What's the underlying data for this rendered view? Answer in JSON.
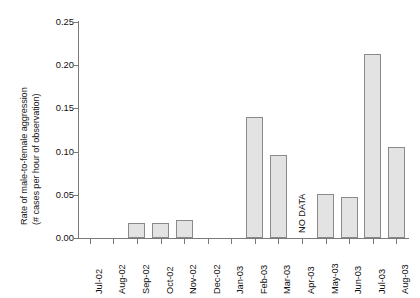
{
  "chart_data": {
    "type": "bar",
    "title": "",
    "xlabel": "",
    "ylabel_line1": "Rate of male-to-female aggression",
    "ylabel_line2": "(# cases per hour of observation)",
    "ylim": [
      0,
      0.25
    ],
    "ytick_labels": [
      "0.25",
      "0.20",
      "0.15",
      "0.10",
      "0.05",
      "0.00"
    ],
    "ytick_values": [
      0.25,
      0.2,
      0.15,
      0.1,
      0.05,
      0.0
    ],
    "grid": false,
    "legend": "none",
    "categories": [
      "Jul-02",
      "Aug-02",
      "Sep-02",
      "Oct-02",
      "Nov-02",
      "Dec-02",
      "Jan-03",
      "Feb-03",
      "Mar-03",
      "Apr-03",
      "May-03",
      "Jun-03",
      "Jul-03",
      "Aug-03"
    ],
    "values": [
      0,
      0,
      0.017,
      0.017,
      0.021,
      0,
      0,
      0.14,
      0.096,
      null,
      0.051,
      0.047,
      0.213,
      0.105
    ],
    "annotations": [
      {
        "text": "NO DATA",
        "category": "Apr-03",
        "orientation": "vertical"
      }
    ],
    "bar_fill": "#e3e3e3",
    "bar_edge": "#8a8a8a",
    "axis_color": "#7a7a7a"
  }
}
